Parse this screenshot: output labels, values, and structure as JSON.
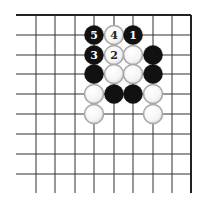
{
  "diagram": {
    "type": "go-board-corner",
    "corner": "top-right",
    "colors": {
      "background": "#ffffff",
      "line": "#333333",
      "edge": "#222222",
      "black_stone": "#111111",
      "white_stone_fill": "#ffffff",
      "white_stone_ring": "#a8a8a8",
      "black_label": "#ffffff",
      "white_label": "#222222"
    },
    "grid": {
      "x": [
        36,
        55,
        75,
        94,
        114,
        133,
        153,
        172,
        191
      ],
      "y": [
        15,
        35,
        55,
        74,
        94,
        114,
        134,
        154,
        174
      ],
      "left_start": 16,
      "bottom_end": 193,
      "top_edge_y": 15,
      "right_edge_x": 191
    },
    "stone_radius": 9.5,
    "stones": [
      {
        "col": 3,
        "row": 1,
        "color": "black",
        "label": "5"
      },
      {
        "col": 4,
        "row": 1,
        "color": "white",
        "label": "4"
      },
      {
        "col": 5,
        "row": 1,
        "color": "black",
        "label": "1"
      },
      {
        "col": 3,
        "row": 2,
        "color": "black",
        "label": "3"
      },
      {
        "col": 4,
        "row": 2,
        "color": "white",
        "label": "2"
      },
      {
        "col": 5,
        "row": 2,
        "color": "white",
        "label": ""
      },
      {
        "col": 6,
        "row": 2,
        "color": "black",
        "label": ""
      },
      {
        "col": 3,
        "row": 3,
        "color": "black",
        "label": ""
      },
      {
        "col": 4,
        "row": 3,
        "color": "white",
        "label": ""
      },
      {
        "col": 5,
        "row": 3,
        "color": "white",
        "label": ""
      },
      {
        "col": 6,
        "row": 3,
        "color": "black",
        "label": ""
      },
      {
        "col": 3,
        "row": 4,
        "color": "white",
        "label": ""
      },
      {
        "col": 4,
        "row": 4,
        "color": "black",
        "label": ""
      },
      {
        "col": 5,
        "row": 4,
        "color": "black",
        "label": ""
      },
      {
        "col": 6,
        "row": 4,
        "color": "white",
        "label": ""
      },
      {
        "col": 3,
        "row": 5,
        "color": "white",
        "label": ""
      },
      {
        "col": 6,
        "row": 5,
        "color": "white",
        "label": ""
      }
    ]
  }
}
